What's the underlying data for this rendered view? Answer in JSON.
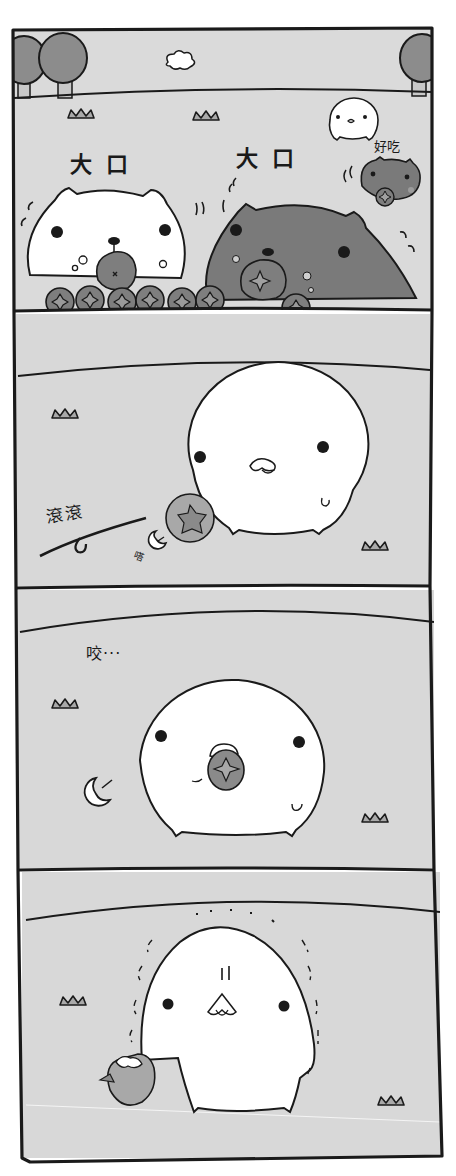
{
  "comic": {
    "panel_count": 4,
    "colors": {
      "background": "#ffffff",
      "panel_fill": "#d8d8d8",
      "sky_fill": "#dcdcdc",
      "ink": "#1a1a1a",
      "dark_character": "#7a7a7a",
      "fruit": "#8a8a8a",
      "fruit_light": "#a8a8a8",
      "white_character": "#ffffff"
    },
    "panels": [
      {
        "id": 1,
        "texts": {
          "sfx_left": "大口",
          "sfx_right": "大口",
          "small_char_speech": "好吃"
        }
      },
      {
        "id": 2,
        "texts": {
          "sfx_roll": "滾滾",
          "sfx_tiny": "嗒"
        }
      },
      {
        "id": 3,
        "texts": {
          "sfx_bite": "咬···"
        }
      },
      {
        "id": 4,
        "texts": {}
      }
    ]
  }
}
